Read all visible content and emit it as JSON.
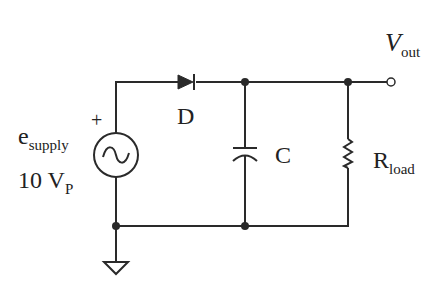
{
  "diagram": {
    "type": "half-wave rectifier with capacitor filter",
    "line_color": "#2a2a2a",
    "background": "#ffffff"
  },
  "labels": {
    "vout": {
      "main": "V",
      "sub": "out"
    },
    "source_name": {
      "main": "e",
      "sub": "supply"
    },
    "source_value": {
      "main": "10 V",
      "sub": "P"
    },
    "plus": "+",
    "diode": "D",
    "capacitor": "C",
    "resistor": {
      "main": "R",
      "sub": "load"
    }
  },
  "components": [
    {
      "id": "source",
      "kind": "ac-voltage-source",
      "label": "e_supply",
      "value": "10 V_P"
    },
    {
      "id": "diode",
      "kind": "diode",
      "label": "D"
    },
    {
      "id": "capacitor",
      "kind": "capacitor",
      "label": "C"
    },
    {
      "id": "resistor",
      "kind": "resistor",
      "label": "R_load"
    },
    {
      "id": "ground",
      "kind": "ground"
    },
    {
      "id": "output",
      "kind": "terminal",
      "label": "V_out"
    }
  ]
}
